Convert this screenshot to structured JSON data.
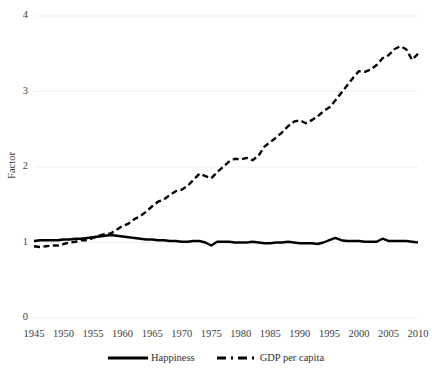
{
  "chart_data": {
    "type": "line",
    "title": "",
    "xlabel": "",
    "ylabel": "Factor",
    "xlim": [
      1945,
      2010
    ],
    "ylim": [
      0,
      4
    ],
    "yticks": [
      0,
      1,
      2,
      3,
      4
    ],
    "xticks": [
      1945,
      1950,
      1955,
      1960,
      1965,
      1970,
      1975,
      1980,
      1985,
      1990,
      1995,
      2000,
      2005,
      2010
    ],
    "grid": "horizontal",
    "legend_position": "bottom",
    "x": [
      1945,
      1946,
      1947,
      1948,
      1949,
      1950,
      1951,
      1952,
      1953,
      1954,
      1955,
      1956,
      1957,
      1958,
      1959,
      1960,
      1961,
      1962,
      1963,
      1964,
      1965,
      1966,
      1967,
      1968,
      1969,
      1970,
      1971,
      1972,
      1973,
      1974,
      1975,
      1976,
      1977,
      1978,
      1979,
      1980,
      1981,
      1982,
      1983,
      1984,
      1985,
      1986,
      1987,
      1988,
      1989,
      1990,
      1991,
      1992,
      1993,
      1994,
      1995,
      1996,
      1997,
      1998,
      1999,
      2000,
      2001,
      2002,
      2003,
      2004,
      2005,
      2006,
      2007,
      2008,
      2009,
      2010
    ],
    "series": [
      {
        "name": "Happiness",
        "style": "solid",
        "color": "#000000",
        "values": [
          1.02,
          1.03,
          1.03,
          1.03,
          1.03,
          1.04,
          1.04,
          1.05,
          1.05,
          1.06,
          1.07,
          1.08,
          1.09,
          1.1,
          1.09,
          1.08,
          1.07,
          1.06,
          1.05,
          1.04,
          1.04,
          1.03,
          1.03,
          1.02,
          1.02,
          1.01,
          1.01,
          1.02,
          1.02,
          1.0,
          0.96,
          1.01,
          1.01,
          1.01,
          1.0,
          1.0,
          1.0,
          1.01,
          1.0,
          0.99,
          0.99,
          1.0,
          1.0,
          1.01,
          1.0,
          0.99,
          0.99,
          0.99,
          0.98,
          1.0,
          1.03,
          1.06,
          1.03,
          1.02,
          1.02,
          1.02,
          1.01,
          1.01,
          1.01,
          1.05,
          1.02,
          1.02,
          1.02,
          1.02,
          1.01,
          1.0
        ]
      },
      {
        "name": "GDP per capita",
        "style": "dashed",
        "color": "#000000",
        "values": [
          0.95,
          0.94,
          0.95,
          0.96,
          0.96,
          0.98,
          1.0,
          1.01,
          1.03,
          1.03,
          1.06,
          1.09,
          1.11,
          1.12,
          1.17,
          1.22,
          1.25,
          1.31,
          1.35,
          1.41,
          1.48,
          1.54,
          1.57,
          1.63,
          1.68,
          1.7,
          1.75,
          1.83,
          1.91,
          1.88,
          1.85,
          1.93,
          2.0,
          2.07,
          2.11,
          2.1,
          2.12,
          2.09,
          2.15,
          2.27,
          2.33,
          2.39,
          2.46,
          2.54,
          2.6,
          2.62,
          2.58,
          2.62,
          2.67,
          2.74,
          2.79,
          2.88,
          2.98,
          3.08,
          3.18,
          3.27,
          3.26,
          3.29,
          3.35,
          3.44,
          3.48,
          3.56,
          3.6,
          3.56,
          3.42,
          3.5
        ]
      }
    ]
  },
  "axis": {
    "y_title": "Factor",
    "y_tick_labels": [
      "4",
      "3",
      "2",
      "1",
      "0"
    ],
    "x_tick_labels": [
      "1945",
      "1950",
      "1955",
      "1960",
      "1965",
      "1970",
      "1975",
      "1980",
      "1985",
      "1990",
      "1995",
      "2000",
      "2005",
      "2010"
    ]
  },
  "legend": {
    "items": [
      {
        "label": "Happiness"
      },
      {
        "label": "GDP per capita"
      }
    ]
  },
  "colors": {
    "line": "#000000",
    "grid": "#efefef",
    "text": "#404040"
  }
}
